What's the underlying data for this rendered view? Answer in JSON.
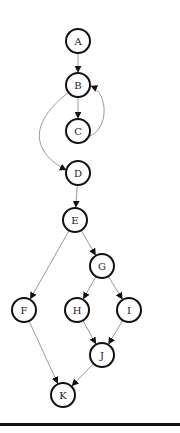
{
  "diagram": {
    "type": "directed-graph",
    "nodes": [
      {
        "id": "A",
        "label": "A",
        "x": 78,
        "y": 41
      },
      {
        "id": "B",
        "label": "B",
        "x": 78,
        "y": 85
      },
      {
        "id": "C",
        "label": "C",
        "x": 78,
        "y": 131
      },
      {
        "id": "D",
        "label": "D",
        "x": 78,
        "y": 173
      },
      {
        "id": "E",
        "label": "E",
        "x": 75,
        "y": 220
      },
      {
        "id": "G",
        "label": "G",
        "x": 102,
        "y": 266
      },
      {
        "id": "F",
        "label": "F",
        "x": 24,
        "y": 310
      },
      {
        "id": "H",
        "label": "H",
        "x": 77,
        "y": 310
      },
      {
        "id": "I",
        "label": "I",
        "x": 129,
        "y": 310
      },
      {
        "id": "J",
        "label": "J",
        "x": 102,
        "y": 355
      },
      {
        "id": "K",
        "label": "K",
        "x": 63,
        "y": 395
      }
    ],
    "edges": [
      {
        "from": "A",
        "to": "B"
      },
      {
        "from": "B",
        "to": "C"
      },
      {
        "from": "C",
        "to": "B",
        "curved": true
      },
      {
        "from": "B",
        "to": "D",
        "curved": true
      },
      {
        "from": "D",
        "to": "E"
      },
      {
        "from": "E",
        "to": "F"
      },
      {
        "from": "E",
        "to": "G"
      },
      {
        "from": "G",
        "to": "H"
      },
      {
        "from": "G",
        "to": "I"
      },
      {
        "from": "H",
        "to": "J"
      },
      {
        "from": "I",
        "to": "J"
      },
      {
        "from": "F",
        "to": "K"
      },
      {
        "from": "J",
        "to": "K"
      }
    ],
    "node_radius": 12,
    "colors": {
      "node_stroke": "#111111",
      "node_fill": "#ffffff",
      "edge_stroke": "#9a9a9a",
      "arrow_fill": "#111111",
      "rule": "#111111"
    }
  }
}
